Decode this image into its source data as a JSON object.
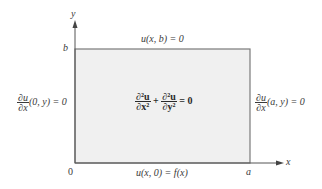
{
  "diagram": {
    "axes": {
      "x_label": "x",
      "y_label": "y",
      "origin_label": "0",
      "a_label": "a",
      "b_label": "b"
    },
    "colors": {
      "region_fill": "#f0f0f0",
      "line": "#6e6e6e",
      "text": "#3a3a3a"
    },
    "boundary_conditions": {
      "top": "u(x, b) = 0",
      "bottom": "u(x, 0) = f(x)",
      "left": {
        "num": "∂u",
        "den": "∂x",
        "rest": "(0, y) = 0"
      },
      "right": {
        "num": "∂u",
        "den": "∂x",
        "rest": "(a, y) = 0"
      }
    },
    "equation": {
      "term1_num": "∂²u",
      "term1_den": "∂x²",
      "plus": "+",
      "term2_num": "∂²u",
      "term2_den": "∂y²",
      "rhs": "= 0"
    }
  }
}
